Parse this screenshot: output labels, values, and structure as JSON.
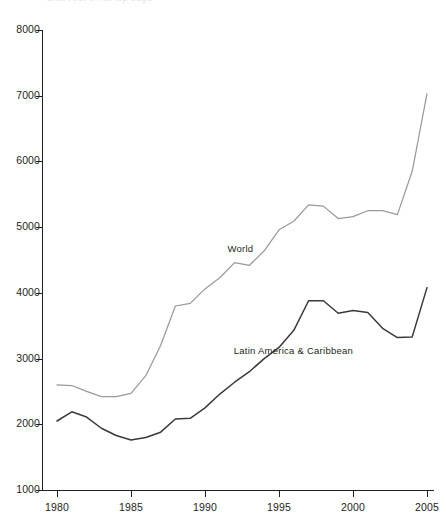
{
  "title_fragment": "Chart cut off at top edge",
  "chart_data": {
    "type": "line",
    "title": "",
    "subtitle": "",
    "xlabel": "",
    "ylabel": "",
    "xlim": [
      1980,
      2005
    ],
    "ylim": [
      1000,
      8000
    ],
    "grid": false,
    "legend_position": "inline-labels",
    "x_ticks": [
      "1980",
      "1985",
      "1990",
      "1995",
      "2000",
      "2005"
    ],
    "y_ticks": [
      "1000",
      "2000",
      "3000",
      "4000",
      "5000",
      "6000",
      "7000",
      "8000"
    ],
    "x": [
      1980,
      1981,
      1982,
      1983,
      1984,
      1985,
      1986,
      1987,
      1988,
      1989,
      1990,
      1991,
      1992,
      1993,
      1994,
      1995,
      1996,
      1997,
      1998,
      1999,
      2000,
      2001,
      2002,
      2003,
      2004,
      2005
    ],
    "series": [
      {
        "name": "World",
        "color": "#9a9a9a",
        "label_x": 1993,
        "label_y": 4660,
        "values": [
          2600,
          2590,
          2500,
          2420,
          2420,
          2470,
          2740,
          3200,
          3800,
          3840,
          4060,
          4230,
          4460,
          4420,
          4640,
          4960,
          5090,
          5340,
          5320,
          5130,
          5160,
          5250,
          5250,
          5190,
          5850,
          7030
        ]
      },
      {
        "name": "Latin America & Caribbean",
        "color": "#3a3a3a",
        "label_x": 1996,
        "label_y": 3120,
        "values": [
          2050,
          2190,
          2110,
          1940,
          1830,
          1760,
          1800,
          1880,
          2080,
          2090,
          2250,
          2460,
          2640,
          2800,
          3000,
          3170,
          3430,
          3880,
          3880,
          3690,
          3730,
          3700,
          3460,
          3320,
          3330,
          4080
        ]
      }
    ],
    "annotations": []
  },
  "axis": {
    "y_axis_name": "value-axis",
    "x_axis_name": "year-axis"
  }
}
